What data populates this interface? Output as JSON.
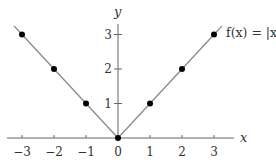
{
  "chart_data": {
    "type": "line",
    "title": "",
    "function_label": "f(x) = |x|",
    "xlabel": "x",
    "ylabel": "y",
    "xlim": [
      -3.5,
      3.7
    ],
    "ylim": [
      0,
      3.4
    ],
    "grid": false,
    "x_ticks": [
      -3,
      -2,
      -1,
      0,
      1,
      2,
      3
    ],
    "x_tick_labels": [
      "−3",
      "−2",
      "−1",
      "0",
      "1",
      "2",
      "3"
    ],
    "y_ticks": [
      1,
      2,
      3
    ],
    "y_tick_labels": [
      "1",
      "2",
      "3"
    ],
    "series": [
      {
        "name": "f(x) = |x|",
        "x": [
          -3,
          -2,
          -1,
          0,
          1,
          2,
          3
        ],
        "y": [
          3,
          2,
          1,
          0,
          1,
          2,
          3
        ],
        "markers": true
      }
    ],
    "colors": {
      "line": "#8a8a8a",
      "markers": "#000000",
      "axes": "#555555",
      "text": "#333333"
    }
  }
}
